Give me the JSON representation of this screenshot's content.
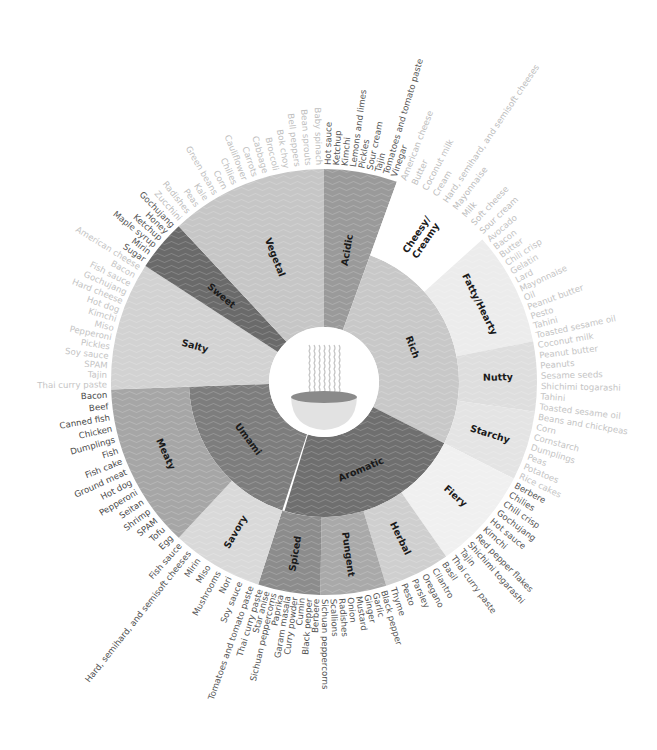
{
  "chart_data": {
    "type": "sunburst",
    "title": "",
    "center_icon": "noodle-bowl-icon",
    "center": [
      324,
      382
    ],
    "radii": {
      "hole": 55,
      "inner": 135,
      "outer": 213,
      "label_start": 217
    },
    "segments": [
      {
        "name": "Acidic",
        "start": 0,
        "end": 20,
        "ring": "full",
        "color": "#9a9a9a",
        "label_color": "#555555",
        "items": [
          "Hot sauce",
          "Ketchup",
          "Kimchi",
          "Lemons and limes",
          "Pickles",
          "Sour cream",
          "Tajin",
          "Tomatoes and tomato paste",
          "Vinegar"
        ]
      },
      {
        "name": "Rich",
        "start": 20,
        "end": 117,
        "ring": "inner",
        "color": "#c8c8c8",
        "children": [
          {
            "name": "Cheesy/ Creamy",
            "start": 20,
            "end": 48,
            "color": "#ffffff",
            "label_color": "#bdbdbd",
            "items": [
              "American cheese",
              "Butter",
              "Coconut milk",
              "Cream",
              "Hard, semihard, and semisoft cheeses",
              "Mayonnaise",
              "Milk",
              "Soft cheese",
              "Sour cream"
            ]
          },
          {
            "name": "Fatty/Hearty",
            "start": 48,
            "end": 79,
            "color": "#ececec",
            "label_color": "#c4c4c4",
            "items": [
              "Avocado",
              "Bacon",
              "Butter",
              "Chili crisp",
              "Gelatin",
              "Lard",
              "Mayonnaise",
              "Oil",
              "Peanut butter",
              "Pesto",
              "Tahini",
              "Toasted sesame oil"
            ]
          },
          {
            "name": "Nutty",
            "start": 79,
            "end": 98,
            "color": "#dedede",
            "label_color": "#c4c4c4",
            "items": [
              "Coconut milk",
              "Peanut butter",
              "Peanuts",
              "Sesame seeds",
              "Shichimi togarashi",
              "Tahini",
              "Toasted sesame oil"
            ]
          },
          {
            "name": "Starchy",
            "start": 98,
            "end": 117,
            "color": "#e4e4e4",
            "label_color": "#c4c4c4",
            "items": [
              "Beans and chickpeas",
              "Corn",
              "Cornstarch",
              "Dumplings",
              "Peas",
              "Potatoes",
              "Rice cakes"
            ]
          }
        ]
      },
      {
        "name": "Aromatic",
        "start": 117,
        "end": 197,
        "ring": "inner",
        "color": "#6f6f6f",
        "children": [
          {
            "name": "Fiery",
            "start": 117,
            "end": 145,
            "color": "#f0f0f0",
            "label_color": "#555555",
            "items": [
              "Berbere",
              "Chilies",
              "Chili crisp",
              "Gochujang",
              "Hot sauce",
              "Kimchi",
              "Red pepper flakes",
              "Shichimi togarashi",
              "Tajin",
              "Thai curry paste"
            ]
          },
          {
            "name": "Herbal",
            "start": 145,
            "end": 163,
            "color": "#cfcfcf",
            "label_color": "#555555",
            "items": [
              "Basil",
              "Cilantro",
              "Oregano",
              "Parsley",
              "Pesto",
              "Thyme"
            ]
          },
          {
            "name": "Pungent",
            "start": 163,
            "end": 181,
            "color": "#a9a9a9",
            "label_color": "#555555",
            "items": [
              "Black pepper",
              "Garlic",
              "Ginger",
              "Mustard",
              "Onion",
              "Radishes",
              "Scallions",
              "Sichuan peppercorns"
            ]
          },
          {
            "name": "Spiced",
            "start": 181,
            "end": 198,
            "color": "#8c8c8c",
            "label_color": "#555555",
            "items": [
              "Berbere",
              "Black pepper",
              "Cumin",
              "Curry powder",
              "Garam masala",
              "Paprika",
              "Sichuan peppercorns",
              "Star anise",
              "Thai curry paste"
            ]
          }
        ]
      },
      {
        "name": "Umami",
        "start": 198,
        "end": 268,
        "ring": "inner",
        "color": "#7d7d7d",
        "children": [
          {
            "name": "Savory",
            "start": 198,
            "end": 223,
            "color": "#d9d9d9",
            "label_color": "#555555",
            "items": [
              "Tomatoes and tomato paste",
              "Soy sauce",
              "Nori",
              "Mushrooms",
              "Miso",
              "Mirin",
              "Hard, semihard, and semisoft cheeses",
              "Fish sauce"
            ]
          },
          {
            "name": "Meaty",
            "start": 223,
            "end": 268,
            "color": "#a6a6a6",
            "label_color": "#4a4a4a",
            "items": [
              "Egg",
              "Tofu",
              "SPAM",
              "Shrimp",
              "Seitan",
              "Pepperoni",
              "Hot dog",
              "Ground meat",
              "Fish cake",
              "Fish",
              "Dumplings",
              "Chicken",
              "Canned fish",
              "Beef",
              "Bacon"
            ]
          }
        ]
      },
      {
        "name": "Salty",
        "start": 268,
        "end": 303,
        "ring": "full",
        "color": "#d2d2d2",
        "label_color": "#c4c4c4",
        "items": [
          "Thai curry paste",
          "Tajin",
          "SPAM",
          "Soy sauce",
          "Pickles",
          "Pepperoni",
          "Miso",
          "Kimchi",
          "Hot dog",
          "Hard cheese",
          "Gochujang",
          "Fish sauce",
          "Bacon",
          "American cheese"
        ]
      },
      {
        "name": "Sweet",
        "start": 303,
        "end": 317,
        "ring": "full",
        "color": "#6a6a6a",
        "label_color": "#555555",
        "items": [
          "Sugar",
          "Mirin",
          "Maple syrup",
          "Ketchup",
          "Honey",
          "Gochujang"
        ]
      },
      {
        "name": "Vegetal",
        "start": 317,
        "end": 360,
        "ring": "full",
        "color": "#c6c6c6",
        "label_color": "#c0c0c0",
        "items": [
          "Zucchini",
          "Radishes",
          "Peas",
          "Kale",
          "Green beans",
          "Corn",
          "Chilies",
          "Cauliflower",
          "Carrots",
          "Cabbage",
          "Broccoli",
          "Bok choy",
          "Bell peppers",
          "Bean sprouts",
          "Baby spinach"
        ]
      }
    ]
  }
}
